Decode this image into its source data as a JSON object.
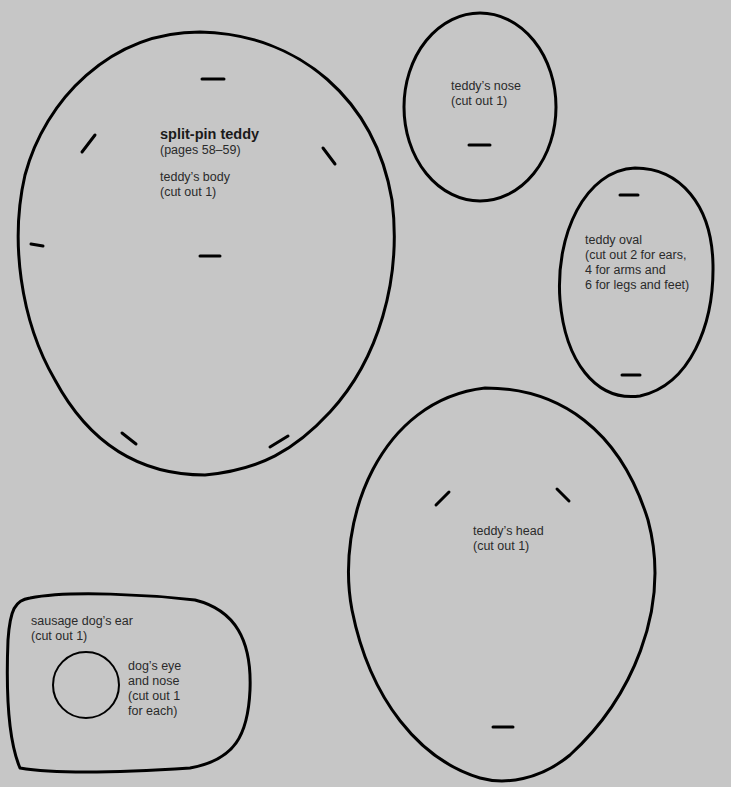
{
  "page": {
    "background_color": "#c6c6c6",
    "stroke_color": "#000000"
  },
  "body_piece": {
    "title": "split-pin teddy",
    "pages": "(pages 58–59)",
    "name": "teddy’s body",
    "instruction": "(cut out 1)"
  },
  "nose_piece": {
    "name": "teddy’s nose",
    "instruction": "(cut out 1)"
  },
  "oval_piece": {
    "name": "teddy oval",
    "lines": [
      "(cut out 2 for ears,",
      "4 for arms and",
      "6 for legs and feet)"
    ]
  },
  "head_piece": {
    "name": "teddy’s head",
    "instruction": "(cut out 1)"
  },
  "ear_piece": {
    "name": "sausage dog’s ear",
    "instruction": "(cut out 1)"
  },
  "eye_piece": {
    "lines": [
      "dog’s eye",
      "and nose",
      "(cut out 1",
      "for each)"
    ]
  }
}
